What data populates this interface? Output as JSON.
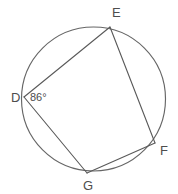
{
  "figure": {
    "type": "geometry-diagram",
    "background_color": "#ffffff",
    "stroke_color": "#595959",
    "circle_color": "#666666",
    "label_color": "#4d4d4d"
  },
  "circle": {
    "name": "circumscribed-circle",
    "cx": 93.5,
    "cy": 99,
    "r": 72
  },
  "vertices": [
    {
      "id": "D",
      "label": "D",
      "x": 24,
      "y": 97,
      "label_x": 11,
      "label_y": 102
    },
    {
      "id": "E",
      "label": "E",
      "x": 110,
      "y": 27,
      "label_x": 112,
      "label_y": 17
    },
    {
      "id": "F",
      "label": "F",
      "x": 155,
      "y": 143,
      "label_x": 160,
      "label_y": 155
    },
    {
      "id": "G",
      "label": "G",
      "x": 87,
      "y": 173,
      "label_x": 83,
      "label_y": 190
    }
  ],
  "chords": [
    {
      "name": "chord-D-E",
      "from": "D",
      "to": "E",
      "x1": 24,
      "y1": 97,
      "x2": 110,
      "y2": 27
    },
    {
      "name": "chord-E-F",
      "from": "E",
      "to": "F",
      "x1": 110,
      "y1": 27,
      "x2": 155,
      "y2": 143
    },
    {
      "name": "chord-F-G",
      "from": "F",
      "to": "G",
      "x1": 155,
      "y1": 143,
      "x2": 87,
      "y2": 173
    },
    {
      "name": "chord-G-D",
      "from": "G",
      "to": "D",
      "x1": 87,
      "y1": 173,
      "x2": 24,
      "y2": 97
    }
  ],
  "angles": [
    {
      "name": "angle-at-D",
      "vertex": "D",
      "value": "86°",
      "label_x": 30,
      "label_y": 101
    }
  ]
}
